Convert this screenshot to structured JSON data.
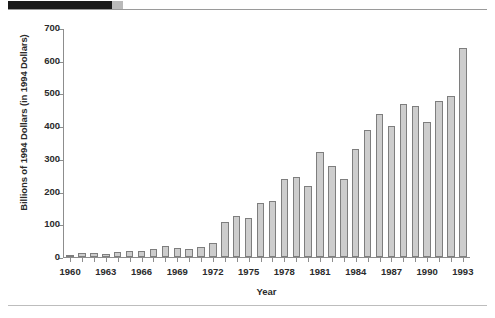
{
  "figure": {
    "x_axis_title": "Year",
    "y_axis_title": "Billions of 1994 Dollars (in 1994 Dollars)"
  },
  "chart_data": {
    "type": "bar",
    "title": "",
    "subtitle": "",
    "xlabel": "Year",
    "ylabel": "Billions of 1994 Dollars (in 1994 Dollars)",
    "xlim": [
      1959.4,
      1993.6
    ],
    "ylim": [
      0,
      700
    ],
    "ytick_labels": [
      "0",
      "100",
      "200",
      "300",
      "400",
      "500",
      "600",
      "700"
    ],
    "yticks": [
      0,
      100,
      200,
      300,
      400,
      500,
      600,
      700
    ],
    "xtick_labels": [
      "1960",
      "1963",
      "1966",
      "1969",
      "1972",
      "1975",
      "1978",
      "1981",
      "1984",
      "1987",
      "1990",
      "1993"
    ],
    "xticks": [
      1960,
      1963,
      1966,
      1969,
      1972,
      1975,
      1978,
      1981,
      1984,
      1987,
      1990,
      1993
    ],
    "grid": false,
    "legend": null,
    "legend_position": "none",
    "bar_fill_color": "#cdcdcd",
    "bar_edge_color": "#7e7e7e",
    "categories": [
      1960,
      1961,
      1962,
      1963,
      1964,
      1965,
      1966,
      1967,
      1968,
      1969,
      1970,
      1971,
      1972,
      1973,
      1974,
      1975,
      1976,
      1977,
      1978,
      1979,
      1980,
      1981,
      1982,
      1983,
      1984,
      1985,
      1986,
      1987,
      1988,
      1989,
      1990,
      1991,
      1992,
      1993
    ],
    "values": [
      6,
      11,
      11,
      10,
      16,
      18,
      18,
      24,
      35,
      28,
      25,
      31,
      43,
      107,
      124,
      120,
      165,
      171,
      238,
      244,
      216,
      320,
      279,
      238,
      330,
      387,
      436,
      402,
      468,
      463,
      412,
      476,
      491,
      638
    ]
  }
}
